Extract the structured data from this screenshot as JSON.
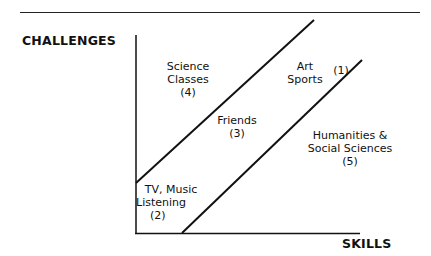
{
  "diagram": {
    "y_axis_label": "CHALLENGES",
    "x_axis_label": "SKILLS",
    "regions": [
      {
        "id": 1,
        "line1": "",
        "line2": "",
        "number": "(1)"
      },
      {
        "id": "art",
        "line1": "Art",
        "line2": "Sports"
      },
      {
        "id": 2,
        "line1": "TV, Music",
        "line2": "Listening",
        "number": "(2)"
      },
      {
        "id": 3,
        "line1": "Friends",
        "number": "(3)"
      },
      {
        "id": 4,
        "line1": "Science",
        "line2": "Classes",
        "number": "(4)"
      },
      {
        "id": 5,
        "line1": "Humanities &",
        "line2": "Social Sciences",
        "number": "(5)"
      }
    ]
  }
}
